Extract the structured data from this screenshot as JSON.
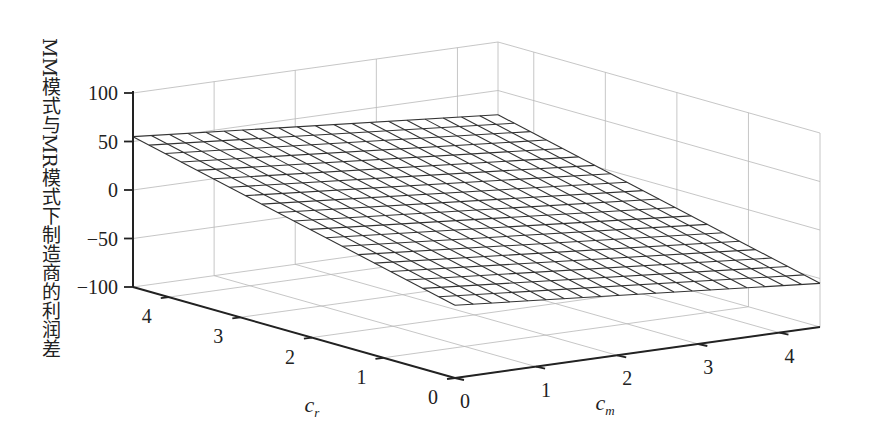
{
  "chart_data": {
    "type": "surface3d",
    "title": "",
    "xlabel": "c_m",
    "ylabel": "c_r",
    "zlabel": "MM模式与MR模式下制造商的利润差",
    "x_ticks": [
      "0",
      "1",
      "2",
      "3",
      "4"
    ],
    "y_ticks": [
      "0",
      "1",
      "2",
      "3",
      "4"
    ],
    "z_ticks": [
      "100",
      "50",
      "0",
      "-50",
      "-100"
    ],
    "xlim": [
      0,
      4.5
    ],
    "ylim": [
      0,
      4.5
    ],
    "zlim": [
      -100,
      100
    ],
    "grid": true,
    "mesh_resolution": [
      20,
      20
    ],
    "surface": {
      "description": "Planar wireframe surface; high near c_m=0, c_r large; lowest near c_m=4.5, c_r=0",
      "corners": [
        {
          "c_m": 0,
          "c_r": 4.5,
          "z": 55
        },
        {
          "c_m": 4.5,
          "c_r": 4.5,
          "z": 20
        },
        {
          "c_m": 4.5,
          "c_r": 0,
          "z": -55
        },
        {
          "c_m": 0,
          "c_r": 0,
          "z": -25
        }
      ]
    },
    "legend": null
  },
  "labels": {
    "zlabel": "MM模式与MR模式下制造商的利润差",
    "xlabel_base": "c",
    "xlabel_sub": "m",
    "ylabel_base": "c",
    "ylabel_sub": "r",
    "z_ticks": [
      "100",
      "50",
      "0",
      "−50",
      "−100"
    ],
    "cr_ticks": [
      "4",
      "3",
      "2",
      "1",
      "0"
    ],
    "cm_ticks": [
      "0",
      "1",
      "2",
      "3",
      "4"
    ]
  },
  "colors": {
    "background": "#ffffff",
    "axis": "#222222",
    "grid": "#b8b8b8",
    "mesh": "#333333",
    "mesh_fill": "#ffffff"
  }
}
